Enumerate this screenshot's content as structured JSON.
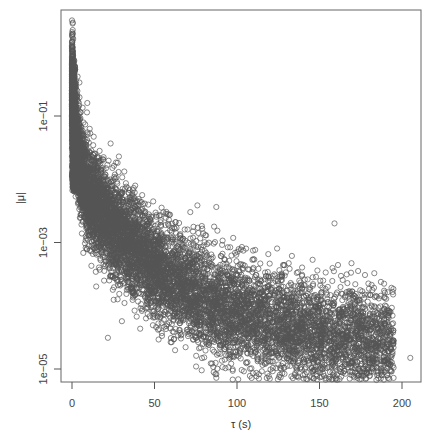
{
  "chart_data": {
    "type": "scatter",
    "title": "",
    "xlabel": "τ (s)",
    "ylabel": "|μ|",
    "x_scale": "linear",
    "y_scale": "log",
    "xlim": [
      -4,
      210
    ],
    "ylim": [
      3e-06,
      20
    ],
    "x_ticks": [
      0,
      50,
      100,
      150,
      200
    ],
    "x_tick_labels": [
      "0",
      "50",
      "100",
      "150",
      "200"
    ],
    "y_ticks": [
      0.1,
      0.001,
      1e-05
    ],
    "y_tick_labels": [
      "1e−01",
      "1e−03",
      "1e−05"
    ],
    "grid": false,
    "legend": null,
    "marker": "open-circle",
    "marker_color": "#555555",
    "series": [
      {
        "name": "points",
        "description": "Dense cloud of open circles decaying from |μ|≈3 at τ≈0 to ≈1e−05 near τ≈200",
        "envelope_center": [
          {
            "x": 0,
            "y": 0.3
          },
          {
            "x": 2,
            "y": 0.05
          },
          {
            "x": 5,
            "y": 0.015
          },
          {
            "x": 10,
            "y": 0.006
          },
          {
            "x": 20,
            "y": 0.0025
          },
          {
            "x": 30,
            "y": 0.0012
          },
          {
            "x": 50,
            "y": 0.0004
          },
          {
            "x": 75,
            "y": 0.00015
          },
          {
            "x": 100,
            "y": 8e-05
          },
          {
            "x": 125,
            "y": 5e-05
          },
          {
            "x": 150,
            "y": 3.5e-05
          },
          {
            "x": 175,
            "y": 2.7e-05
          },
          {
            "x": 200,
            "y": 2.2e-05
          }
        ],
        "outliers": [
          {
            "x": 0.5,
            "y": 3.0
          },
          {
            "x": 0.5,
            "y": 2.0
          },
          {
            "x": 0.5,
            "y": 1.2
          },
          {
            "x": 0.5,
            "y": 0.8
          },
          {
            "x": 150,
            "y": 0.0001
          },
          {
            "x": 128,
            "y": 0.0002
          },
          {
            "x": 140,
            "y": 8e-06
          },
          {
            "x": 158,
            "y": 7e-06
          },
          {
            "x": 205,
            "y": 1.5e-05
          }
        ]
      }
    ]
  }
}
